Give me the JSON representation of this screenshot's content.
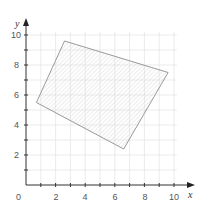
{
  "chart_data": {
    "type": "scatter",
    "title": "",
    "xlabel": "x",
    "ylabel": "y",
    "xlim": [
      0,
      10.5
    ],
    "ylim": [
      0,
      10.5
    ],
    "grid": true,
    "x_ticks": [
      2,
      4,
      6,
      8,
      10
    ],
    "y_ticks": [
      2,
      4,
      6,
      8,
      10
    ],
    "x_tick_labels": [
      "0",
      "2",
      "4",
      "6",
      "8",
      "10"
    ],
    "y_tick_labels": [
      "2",
      "4",
      "6",
      "8",
      "10"
    ],
    "series": [
      {
        "name": "shaded quadrilateral",
        "shape": "polygon",
        "fill": "hatched",
        "points": [
          {
            "x": 0.7,
            "y": 5.5
          },
          {
            "x": 2.6,
            "y": 9.6
          },
          {
            "x": 9.6,
            "y": 7.5
          },
          {
            "x": 6.6,
            "y": 2.4
          }
        ]
      }
    ]
  },
  "colors": {
    "axis": "#333333",
    "grid": "#e2e2e2",
    "polygon_stroke": "#9a9a9a",
    "hatch": "#cfcfcf",
    "label": "#555555"
  },
  "labels": {
    "origin": "0",
    "x_axis": "x",
    "y_axis": "y",
    "x_ticks": [
      "2",
      "4",
      "6",
      "8",
      "10"
    ],
    "y_ticks": [
      "2",
      "4",
      "6",
      "8",
      "10"
    ]
  }
}
